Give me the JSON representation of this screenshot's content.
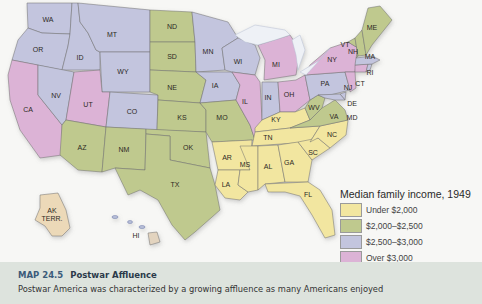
{
  "legend": {
    "title": "Median family income, 1949",
    "items": [
      {
        "label": "Under $2,000",
        "color": "#f2e6a0"
      },
      {
        "label": "$2,000–$2,500",
        "color": "#bfc98e"
      },
      {
        "label": "$2,500–$3,000",
        "color": "#c3c5de"
      },
      {
        "label": "Over $3,000",
        "color": "#dcb3d6"
      }
    ]
  },
  "caption": {
    "number": "MAP 24.5",
    "title": "Postwar Affluence",
    "text": "Postwar America was characterized by a growing affluence as many Americans enjoyed"
  },
  "states": {
    "WA": {
      "label": "WA",
      "category": 2
    },
    "OR": {
      "label": "OR",
      "category": 2
    },
    "ID": {
      "label": "ID",
      "category": 2
    },
    "MT": {
      "label": "MT",
      "category": 2
    },
    "WY": {
      "label": "WY",
      "category": 2
    },
    "CA": {
      "label": "CA",
      "category": 3
    },
    "NV": {
      "label": "NV",
      "category": 2
    },
    "UT": {
      "label": "UT",
      "category": 3
    },
    "CO": {
      "label": "CO",
      "category": 2
    },
    "AZ": {
      "label": "AZ",
      "category": 1
    },
    "NM": {
      "label": "NM",
      "category": 1
    },
    "ND": {
      "label": "ND",
      "category": 1
    },
    "SD": {
      "label": "SD",
      "category": 1
    },
    "NE": {
      "label": "NE",
      "category": 1
    },
    "KS": {
      "label": "KS",
      "category": 1
    },
    "OK": {
      "label": "OK",
      "category": 1
    },
    "TX": {
      "label": "TX",
      "category": 1
    },
    "MN": {
      "label": "MN",
      "category": 2
    },
    "IA": {
      "label": "IA",
      "category": 2
    },
    "MO": {
      "label": "MO",
      "category": 1
    },
    "AR": {
      "label": "AR",
      "category": 0
    },
    "LA": {
      "label": "LA",
      "category": 0
    },
    "WI": {
      "label": "WI",
      "category": 2
    },
    "IL": {
      "label": "IL",
      "category": 3
    },
    "MI": {
      "label": "MI",
      "category": 3
    },
    "IN": {
      "label": "IN",
      "category": 2
    },
    "OH": {
      "label": "OH",
      "category": 3
    },
    "KY": {
      "label": "KY",
      "category": 0
    },
    "TN": {
      "label": "TN",
      "category": 0
    },
    "MS": {
      "label": "MS",
      "category": 0
    },
    "AL": {
      "label": "AL",
      "category": 0
    },
    "GA": {
      "label": "GA",
      "category": 0
    },
    "FL": {
      "label": "FL",
      "category": 0
    },
    "SC": {
      "label": "SC",
      "category": 0
    },
    "NC": {
      "label": "NC",
      "category": 0
    },
    "VA": {
      "label": "VA",
      "category": 1
    },
    "WV": {
      "label": "WV",
      "category": 1
    },
    "PA": {
      "label": "PA",
      "category": 2
    },
    "NY": {
      "label": "NY",
      "category": 3
    },
    "VT": {
      "label": "VT",
      "category": 1
    },
    "NH": {
      "label": "NH",
      "category": 1
    },
    "ME": {
      "label": "ME",
      "category": 1
    },
    "MA": {
      "label": "MA",
      "category": 2
    },
    "RI": {
      "label": "RI",
      "category": 2
    },
    "CT": {
      "label": "CT",
      "category": 3
    },
    "NJ": {
      "label": "NJ",
      "category": 3
    },
    "DE": {
      "label": "DE",
      "category": 2
    },
    "MD": {
      "label": "MD",
      "category": 2
    },
    "AK": {
      "label": "AK TERR.",
      "category": -1,
      "color": "#ecd9b8"
    },
    "HI": {
      "label": "HI",
      "category": -1,
      "color": "#e3d4bf"
    }
  }
}
